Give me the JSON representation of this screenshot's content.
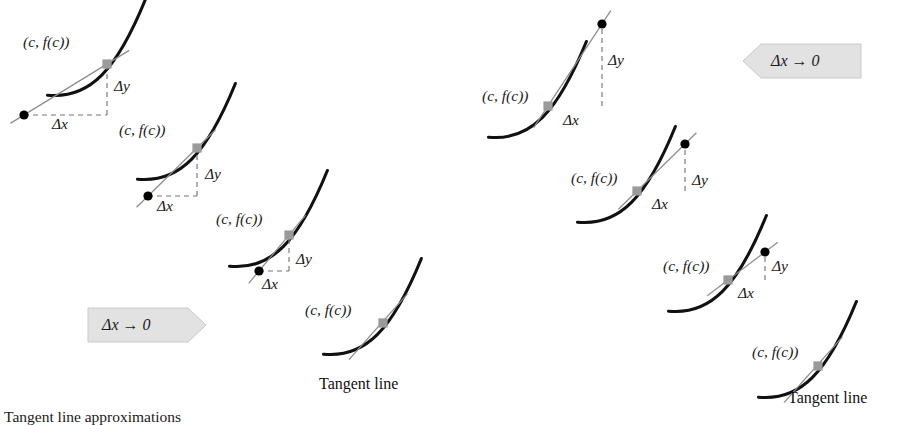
{
  "figure": {
    "caption_partial": "Tangent line approximations",
    "colors": {
      "curve": "#111111",
      "secant": "#8d8d8d",
      "tangent": "#8d8d8d",
      "dashed": "#777777",
      "moving_point": "#000000",
      "fixed_point": "#9a9a9a",
      "banner_fill": "#e2e2e2",
      "banner_edge": "#c9c9c9",
      "text": "#1a1a1a",
      "background": "#ffffff"
    }
  },
  "labels": {
    "point": "(c, f(c))",
    "delta_y": "Δy",
    "delta_x": "Δx",
    "tangent_line": "Tangent line",
    "limit_banner": "Δx → 0"
  },
  "panels": [
    {
      "id": "left",
      "name": "secant-approach-from-right",
      "arrow_direction": "right",
      "banner": {
        "text": "Δx → 0",
        "x": 88,
        "y": 308,
        "width": 118,
        "height": 34
      },
      "stages": [
        {
          "index": 1,
          "name": "stage-1-largest-delta",
          "point_label": {
            "text": "(c, f(c))",
            "x": 23,
            "y": 34
          },
          "delta_y_label": {
            "text": "Δy",
            "x": 114,
            "y": 78
          },
          "delta_x_label": {
            "text": "Δx",
            "x": 52,
            "y": 116
          },
          "fixed_point": {
            "x": 107,
            "y": 64
          },
          "moving_point": {
            "x": 24,
            "y": 115
          },
          "has_triangle": true,
          "has_moving_point": true
        },
        {
          "index": 2,
          "name": "stage-2-medium-delta",
          "point_label": {
            "text": "(c, f(c))",
            "x": 119,
            "y": 122
          },
          "delta_y_label": {
            "text": "Δy",
            "x": 205,
            "y": 166
          },
          "delta_x_label": {
            "text": "Δx",
            "x": 157,
            "y": 198
          },
          "fixed_point": {
            "x": 197,
            "y": 148
          },
          "moving_point": {
            "x": 148,
            "y": 196
          },
          "has_triangle": true,
          "has_moving_point": true
        },
        {
          "index": 3,
          "name": "stage-3-small-delta",
          "point_label": {
            "text": "(c, f(c))",
            "x": 216,
            "y": 211
          },
          "delta_y_label": {
            "text": "Δy",
            "x": 296,
            "y": 251
          },
          "delta_x_label": {
            "text": "Δx",
            "x": 262,
            "y": 276
          },
          "fixed_point": {
            "x": 289,
            "y": 235
          },
          "moving_point": {
            "x": 259,
            "y": 271
          },
          "has_triangle": true,
          "has_moving_point": true
        },
        {
          "index": 4,
          "name": "stage-4-tangent",
          "point_label": {
            "text": "(c, f(c))",
            "x": 305,
            "y": 302
          },
          "tangent_label": {
            "text": "Tangent line",
            "x": 319,
            "y": 376
          },
          "fixed_point": {
            "x": 383,
            "y": 323
          },
          "has_triangle": false,
          "has_moving_point": false
        }
      ]
    },
    {
      "id": "right",
      "name": "secant-approach-from-left",
      "arrow_direction": "left",
      "banner": {
        "text": "Δx → 0",
        "x": 743,
        "y": 44,
        "width": 118,
        "height": 34
      },
      "stages": [
        {
          "index": 1,
          "name": "stage-1-largest-delta",
          "point_label": {
            "text": "(c, f(c))",
            "x": 482,
            "y": 88
          },
          "delta_y_label": {
            "text": "Δy",
            "x": 608,
            "y": 52
          },
          "delta_x_label": {
            "text": "Δx",
            "x": 563,
            "y": 112
          },
          "fixed_point": {
            "x": 548,
            "y": 106
          },
          "moving_point": {
            "x": 602,
            "y": 24
          },
          "has_triangle": true,
          "has_moving_point": true
        },
        {
          "index": 2,
          "name": "stage-2-medium-delta",
          "point_label": {
            "text": "(c, f(c))",
            "x": 571,
            "y": 170
          },
          "delta_y_label": {
            "text": "Δy",
            "x": 692,
            "y": 172
          },
          "delta_x_label": {
            "text": "Δx",
            "x": 652,
            "y": 196
          },
          "fixed_point": {
            "x": 637,
            "y": 191
          },
          "moving_point": {
            "x": 685,
            "y": 144
          },
          "has_triangle": true,
          "has_moving_point": true
        },
        {
          "index": 3,
          "name": "stage-3-small-delta",
          "point_label": {
            "text": "(c, f(c))",
            "x": 663,
            "y": 258
          },
          "delta_y_label": {
            "text": "Δy",
            "x": 772,
            "y": 258
          },
          "delta_x_label": {
            "text": "Δx",
            "x": 738,
            "y": 285
          },
          "fixed_point": {
            "x": 728,
            "y": 280
          },
          "moving_point": {
            "x": 765,
            "y": 252
          },
          "has_triangle": true,
          "has_moving_point": true
        },
        {
          "index": 4,
          "name": "stage-4-tangent",
          "point_label": {
            "text": "(c, f(c))",
            "x": 752,
            "y": 344
          },
          "tangent_label": {
            "text": "Tangent line",
            "x": 788,
            "y": 390
          },
          "fixed_point": {
            "x": 818,
            "y": 366
          },
          "has_triangle": false,
          "has_moving_point": false
        }
      ]
    }
  ]
}
